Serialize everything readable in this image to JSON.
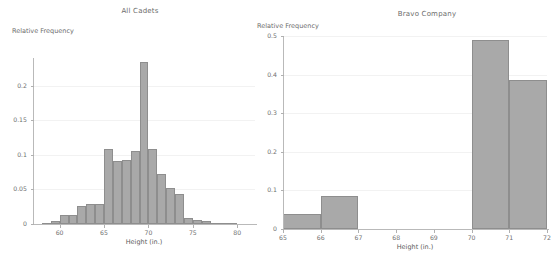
{
  "chart_data": [
    {
      "id": "all-cadets",
      "type": "bar",
      "title": "All Cadets",
      "xlabel": "Height (in.)",
      "ylabel": "Relative Frequency",
      "xlim": [
        57,
        82
      ],
      "ylim": [
        0,
        0.24
      ],
      "xticks": [
        60,
        65,
        70,
        75,
        80
      ],
      "yticks": [
        0,
        0.05,
        0.1,
        0.15,
        0.2
      ],
      "ytick_labels": [
        "0",
        "0.05",
        "0.1",
        "0.15",
        "0.2"
      ],
      "xtick_labels": [
        "60",
        "65",
        "70",
        "75",
        "80"
      ],
      "grid": true,
      "bin_width": 1,
      "bins": [
        {
          "x0": 57,
          "x1": 58,
          "value": 0.0
        },
        {
          "x0": 58,
          "x1": 59,
          "value": 0.001
        },
        {
          "x0": 59,
          "x1": 60,
          "value": 0.004
        },
        {
          "x0": 60,
          "x1": 61,
          "value": 0.013
        },
        {
          "x0": 61,
          "x1": 62,
          "value": 0.013
        },
        {
          "x0": 62,
          "x1": 63,
          "value": 0.026
        },
        {
          "x0": 63,
          "x1": 64,
          "value": 0.029
        },
        {
          "x0": 64,
          "x1": 65,
          "value": 0.029
        },
        {
          "x0": 65,
          "x1": 66,
          "value": 0.109
        },
        {
          "x0": 66,
          "x1": 67,
          "value": 0.091
        },
        {
          "x0": 67,
          "x1": 68,
          "value": 0.092
        },
        {
          "x0": 68,
          "x1": 69,
          "value": 0.105
        },
        {
          "x0": 69,
          "x1": 70,
          "value": 0.234
        },
        {
          "x0": 70,
          "x1": 71,
          "value": 0.108
        },
        {
          "x0": 71,
          "x1": 72,
          "value": 0.072
        },
        {
          "x0": 72,
          "x1": 73,
          "value": 0.052
        },
        {
          "x0": 73,
          "x1": 74,
          "value": 0.044
        },
        {
          "x0": 74,
          "x1": 75,
          "value": 0.008
        },
        {
          "x0": 75,
          "x1": 76,
          "value": 0.006
        },
        {
          "x0": 76,
          "x1": 77,
          "value": 0.004
        },
        {
          "x0": 77,
          "x1": 78,
          "value": 0.002
        },
        {
          "x0": 78,
          "x1": 79,
          "value": 0.001
        },
        {
          "x0": 79,
          "x1": 80,
          "value": 0.001
        },
        {
          "x0": 80,
          "x1": 81,
          "value": 0.0
        }
      ],
      "colors": {
        "bar_fill": "#a9a9a9",
        "bar_edge": "#8e8e8e",
        "axis": "#b9b9b9",
        "grid": "#f2f2f2"
      }
    },
    {
      "id": "bravo-company",
      "type": "bar",
      "title": "Bravo Company",
      "xlabel": "Height (in.)",
      "ylabel": "Relative Frequency",
      "xlim": [
        65,
        72
      ],
      "ylim": [
        0,
        0.5
      ],
      "xticks": [
        65,
        66,
        67,
        68,
        69,
        70,
        71,
        72
      ],
      "yticks": [
        0,
        0.1,
        0.2,
        0.3,
        0.4,
        0.5
      ],
      "ytick_labels": [
        "0",
        "0.1",
        "0.2",
        "0.3",
        "0.4",
        "0.5"
      ],
      "xtick_labels": [
        "65",
        "66",
        "67",
        "68",
        "69",
        "70",
        "71",
        "72"
      ],
      "grid": true,
      "bin_width": 1,
      "bins": [
        {
          "x0": 65,
          "x1": 66,
          "value": 0.0385
        },
        {
          "x0": 66,
          "x1": 67,
          "value": 0.0845
        },
        {
          "x0": 67,
          "x1": 68,
          "value": 0.0
        },
        {
          "x0": 68,
          "x1": 69,
          "value": 0.0
        },
        {
          "x0": 69,
          "x1": 70,
          "value": 0.0
        },
        {
          "x0": 70,
          "x1": 71,
          "value": 0.4885
        },
        {
          "x0": 71,
          "x1": 72,
          "value": 0.3855
        }
      ],
      "colors": {
        "bar_fill": "#a9a9a9",
        "bar_edge": "#8e8e8e",
        "axis": "#b9b9b9",
        "grid": "#f2f2f2"
      }
    }
  ]
}
